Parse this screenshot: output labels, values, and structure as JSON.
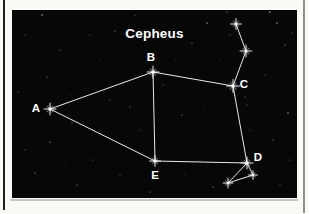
{
  "page": {
    "background_color": "#fbfaf6",
    "left_rule_color": "#1f1f1f",
    "right_rule_color": "#8f8f8f",
    "figure_shadow_color": "#c6c6c6"
  },
  "diagram": {
    "title": "Cepheus",
    "bg_color": "#070707",
    "star_color": "#ffffff",
    "line_color": "#f7f7f2",
    "label_color": "#ffffff",
    "box": {
      "x": 12,
      "y": 10,
      "width": 285,
      "height": 188
    },
    "stars": [
      {
        "id": "A",
        "x": 50,
        "y": 109,
        "core": 1.7,
        "spike": 6.0,
        "label": "A",
        "label_x": 36,
        "label_y": 108
      },
      {
        "id": "B",
        "x": 153,
        "y": 72,
        "core": 1.7,
        "spike": 6.0,
        "label": "B",
        "label_x": 151,
        "label_y": 57
      },
      {
        "id": "C",
        "x": 233,
        "y": 86,
        "core": 1.7,
        "spike": 6.5,
        "label": "C",
        "label_x": 244,
        "label_y": 84
      },
      {
        "id": "D",
        "x": 247,
        "y": 163,
        "core": 1.7,
        "spike": 6.0,
        "label": "D",
        "label_x": 258,
        "label_y": 157
      },
      {
        "id": "E",
        "x": 155,
        "y": 161,
        "core": 1.6,
        "spike": 5.5,
        "label": "E",
        "label_x": 155,
        "label_y": 175
      },
      {
        "id": "M1",
        "x": 236,
        "y": 24,
        "core": 1.5,
        "spike": 5.5,
        "label": ""
      },
      {
        "id": "M2",
        "x": 246,
        "y": 51,
        "core": 1.5,
        "spike": 6.0,
        "label": ""
      },
      {
        "id": "M3",
        "x": 253,
        "y": 175,
        "core": 1.3,
        "spike": 4.5,
        "label": ""
      },
      {
        "id": "M4",
        "x": 228,
        "y": 183,
        "core": 1.3,
        "spike": 5.0,
        "label": ""
      }
    ],
    "lines": [
      [
        "A",
        "B"
      ],
      [
        "A",
        "E"
      ],
      [
        "B",
        "C"
      ],
      [
        "B",
        "E"
      ],
      [
        "E",
        "D"
      ],
      [
        "C",
        "D"
      ],
      [
        "C",
        "M2"
      ],
      [
        "M2",
        "M1"
      ],
      [
        "D",
        "M3"
      ],
      [
        "D",
        "M4"
      ],
      [
        "M3",
        "M4"
      ]
    ],
    "background_stars": [
      [
        42,
        15,
        0.7,
        0.8
      ],
      [
        115,
        31,
        0.6,
        0.6
      ],
      [
        207,
        23,
        0.7,
        0.7
      ],
      [
        227,
        12,
        0.6,
        0.6
      ],
      [
        270,
        12,
        0.7,
        0.8
      ],
      [
        288,
        6,
        0.6,
        0.7
      ],
      [
        277,
        23,
        0.7,
        0.7
      ],
      [
        285,
        45,
        0.6,
        0.6
      ],
      [
        292,
        33,
        0.5,
        0.5
      ],
      [
        192,
        43,
        0.6,
        0.6
      ],
      [
        163,
        85,
        0.5,
        0.5
      ],
      [
        130,
        107,
        0.6,
        0.5
      ],
      [
        182,
        115,
        0.6,
        0.6
      ],
      [
        288,
        113,
        0.7,
        0.7
      ],
      [
        273,
        140,
        0.6,
        0.6
      ],
      [
        47,
        77,
        0.6,
        0.6
      ],
      [
        18,
        92,
        0.5,
        0.5
      ],
      [
        72,
        123,
        0.6,
        0.6
      ],
      [
        50,
        142,
        0.6,
        0.7
      ],
      [
        35,
        173,
        0.6,
        0.6
      ],
      [
        77,
        185,
        0.6,
        0.6
      ],
      [
        93,
        160,
        0.5,
        0.5
      ],
      [
        150,
        192,
        0.6,
        0.6
      ],
      [
        213,
        187,
        0.6,
        0.6
      ],
      [
        200,
        160,
        0.5,
        0.5
      ],
      [
        245,
        97,
        0.5,
        0.6
      ],
      [
        247,
        105,
        0.5,
        0.5
      ],
      [
        110,
        100,
        0.5,
        0.5
      ],
      [
        140,
        130,
        0.5,
        0.4
      ],
      [
        170,
        140,
        0.4,
        0.4
      ],
      [
        60,
        50,
        0.5,
        0.5
      ],
      [
        90,
        35,
        0.5,
        0.4
      ],
      [
        25,
        35,
        0.5,
        0.5
      ],
      [
        25,
        150,
        0.5,
        0.5
      ],
      [
        120,
        175,
        0.5,
        0.5
      ],
      [
        185,
        175,
        0.4,
        0.4
      ],
      [
        265,
        75,
        0.5,
        0.5
      ],
      [
        290,
        160,
        0.5,
        0.5
      ],
      [
        280,
        185,
        0.5,
        0.5
      ],
      [
        220,
        60,
        0.4,
        0.4
      ],
      [
        100,
        60,
        0.4,
        0.4
      ],
      [
        70,
        95,
        0.4,
        0.4
      ],
      [
        135,
        15,
        0.5,
        0.5
      ],
      [
        160,
        30,
        0.4,
        0.4
      ],
      [
        250,
        130,
        0.5,
        0.4
      ],
      [
        30,
        60,
        0.4,
        0.4
      ],
      [
        65,
        165,
        0.4,
        0.4
      ],
      [
        205,
        110,
        0.4,
        0.4
      ],
      [
        230,
        35,
        0.5,
        0.5
      ],
      [
        175,
        60,
        0.4,
        0.4
      ]
    ]
  }
}
